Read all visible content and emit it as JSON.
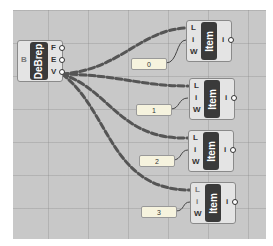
{
  "canvas": {
    "background": "#c8c8c8"
  },
  "debrep": {
    "label": "DeBrep",
    "input": "B",
    "outputs": [
      "F",
      "E",
      "V"
    ]
  },
  "list_items": [
    {
      "label": "Item",
      "inputs": [
        "L",
        "i",
        "W"
      ],
      "output": "i",
      "index_panel": "0"
    },
    {
      "label": "Item",
      "inputs": [
        "L",
        "i",
        "W"
      ],
      "output": "i",
      "index_panel": "1"
    },
    {
      "label": "Item",
      "inputs": [
        "L",
        "i",
        "W"
      ],
      "output": "i",
      "index_panel": "2"
    },
    {
      "label": "Item",
      "inputs": [
        "L",
        "i",
        "W"
      ],
      "output": "i",
      "index_panel": "3"
    }
  ]
}
